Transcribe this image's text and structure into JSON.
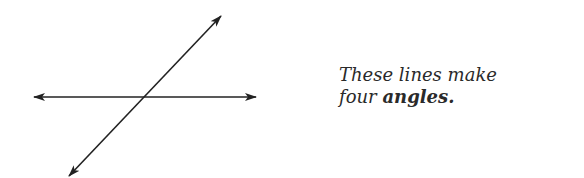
{
  "diagram": {
    "type": "intersecting-lines",
    "line_color": "#222222",
    "lines": [
      {
        "name": "horizontal-line",
        "from": [
          33,
          97
        ],
        "to": [
          257,
          97
        ],
        "arrows": "both"
      },
      {
        "name": "diagonal-line",
        "from": [
          68,
          177
        ],
        "to": [
          222,
          15
        ],
        "arrows": "both"
      }
    ],
    "intersection": [
      144,
      97
    ]
  },
  "caption": {
    "line1": "These lines make",
    "line2_prefix": "four ",
    "line2_bold": "angles."
  }
}
